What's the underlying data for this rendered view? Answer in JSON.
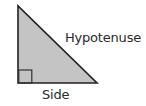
{
  "diagram": {
    "type": "right-triangle",
    "labels": {
      "hypotenuse": "Hypotenuse",
      "side": "Side"
    },
    "colors": {
      "fill": "#c4c4c4",
      "stroke": "#222222",
      "text": "#2a2a2a",
      "background": "#ffffff"
    },
    "vertices": {
      "apex": [
        18,
        6
      ],
      "right_angle": [
        18,
        83
      ],
      "base_end": [
        97,
        83
      ]
    },
    "right_angle_marker_size": 13
  }
}
